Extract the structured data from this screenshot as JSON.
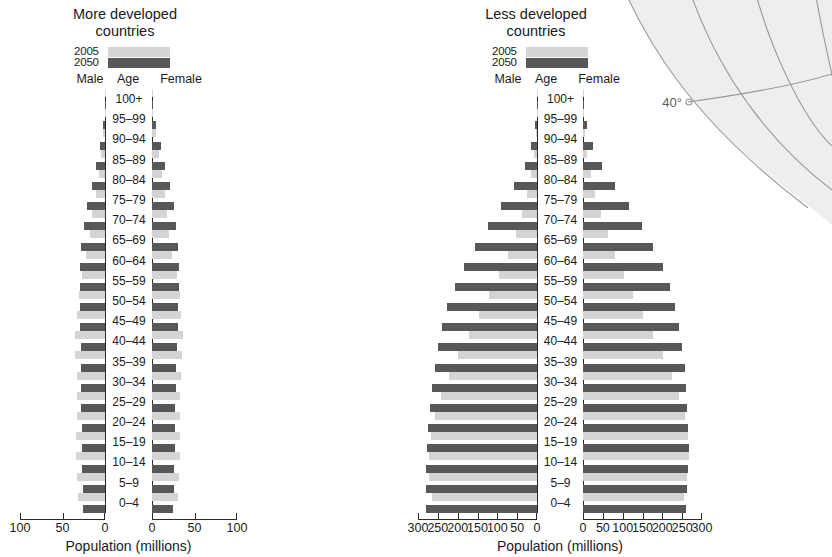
{
  "chart_data": [
    {
      "type": "bar",
      "chart_id": "more-developed",
      "title": "More developed\ncountries",
      "xlabel": "Population (millions)",
      "ylabel": "Age",
      "orientation": "population-pyramid",
      "xlim": [
        -100,
        100
      ],
      "xticks": [
        100,
        50,
        0,
        0,
        50,
        100
      ],
      "grid": false,
      "legend": [
        {
          "name": "2005",
          "color": "#d4d4d4"
        },
        {
          "name": "2050",
          "color": "#585858"
        }
      ],
      "side_labels": {
        "left": "Male",
        "center": "Age",
        "right": "Female"
      },
      "categories": [
        "100+",
        "95–99",
        "90–94",
        "85–89",
        "80–84",
        "75–79",
        "70–74",
        "65–69",
        "60–64",
        "55–59",
        "50–54",
        "45–49",
        "40–44",
        "35–39",
        "30–34",
        "25–29",
        "20–24",
        "15–19",
        "10–14",
        "5–9",
        "0–4"
      ],
      "series": [
        {
          "name": "2005",
          "side": "male",
          "values": [
            0.1,
            0.6,
            1.9,
            4.2,
            7.6,
            11.0,
            14.8,
            17.5,
            22.0,
            27.5,
            31.0,
            33.5,
            35.5,
            35.0,
            33.5,
            33.0,
            33.5,
            34.0,
            34.0,
            33.0,
            32.0
          ]
        },
        {
          "name": "2005",
          "side": "female",
          "values": [
            0.3,
            1.6,
            4.2,
            7.8,
            12.0,
            15.0,
            18.0,
            19.5,
            23.5,
            29.0,
            32.5,
            34.5,
            36.0,
            35.5,
            34.0,
            33.0,
            32.5,
            32.5,
            32.5,
            31.5,
            30.5
          ]
        },
        {
          "name": "2050",
          "side": "male",
          "values": [
            0.5,
            2.2,
            5.4,
            10.2,
            15.6,
            21.0,
            25.0,
            28.0,
            29.5,
            30.0,
            29.5,
            29.0,
            28.5,
            28.0,
            28.0,
            28.0,
            27.5,
            27.0,
            26.5,
            26.0,
            25.5
          ]
        },
        {
          "name": "2050",
          "side": "female",
          "values": [
            1.6,
            5.0,
            10.0,
            15.5,
            21.0,
            25.5,
            28.5,
            30.5,
            31.5,
            31.5,
            30.5,
            30.0,
            29.0,
            28.5,
            28.0,
            27.5,
            27.0,
            26.5,
            26.0,
            25.5,
            24.5
          ]
        }
      ]
    },
    {
      "type": "bar",
      "chart_id": "less-developed",
      "title": "Less developed\ncountries",
      "xlabel": "Population (millions)",
      "ylabel": "Age",
      "orientation": "population-pyramid",
      "xlim": [
        -300,
        300
      ],
      "xticks": [
        300,
        250,
        200,
        150,
        100,
        50,
        0,
        0,
        50,
        100,
        150,
        200,
        250,
        300
      ],
      "grid": false,
      "legend": [
        {
          "name": "2005",
          "color": "#d4d4d4"
        },
        {
          "name": "2050",
          "color": "#585858"
        }
      ],
      "side_labels": {
        "left": "Male",
        "center": "Age",
        "right": "Female"
      },
      "categories": [
        "100+",
        "95–99",
        "90–94",
        "85–89",
        "80–84",
        "75–79",
        "70–74",
        "65–69",
        "60–64",
        "55–59",
        "50–54",
        "45–49",
        "40–44",
        "35–39",
        "30–34",
        "25–29",
        "20–24",
        "15–19",
        "10–14",
        "5–9",
        "0–4"
      ],
      "series": [
        {
          "name": "2005",
          "side": "male",
          "values": [
            0.2,
            1.0,
            3.0,
            7.0,
            14.0,
            24.0,
            38.0,
            54.0,
            72.0,
            95.0,
            120.0,
            146.0,
            172.0,
            198.0,
            222.0,
            243.0,
            258.0,
            268.0,
            273.0,
            272.0,
            265.0
          ]
        },
        {
          "name": "2005",
          "side": "female",
          "values": [
            0.4,
            1.8,
            4.8,
            10.5,
            19.0,
            31.0,
            46.0,
            63.0,
            81.0,
            103.0,
            127.0,
            152.0,
            177.0,
            202.0,
            224.0,
            243.0,
            256.0,
            264.0,
            266.0,
            263.0,
            254.0
          ]
        },
        {
          "name": "2050",
          "side": "male",
          "values": [
            1.0,
            5.0,
            14.0,
            31.0,
            57.0,
            90.0,
            124.0,
            156.0,
            185.0,
            208.0,
            227.0,
            240.0,
            250.0,
            258.0,
            264.0,
            270.0,
            274.0,
            277.0,
            279.0,
            280.0,
            281.0
          ]
        },
        {
          "name": "2050",
          "side": "female",
          "values": [
            3.0,
            11.0,
            26.0,
            49.0,
            80.0,
            115.0,
            148.0,
            177.0,
            201.0,
            219.0,
            233.0,
            243.0,
            250.0,
            256.0,
            260.0,
            263.0,
            265.0,
            266.0,
            265.0,
            263.0,
            260.0
          ]
        }
      ]
    }
  ],
  "map_decoration": {
    "latitude_label": "40°"
  }
}
